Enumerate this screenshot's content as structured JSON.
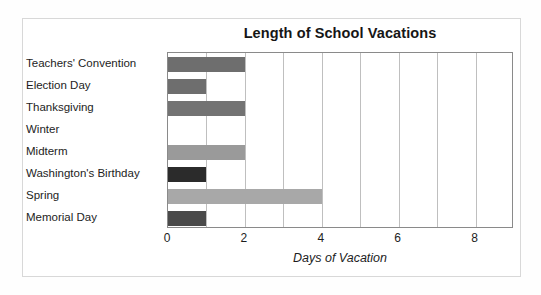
{
  "chart_data": {
    "type": "bar",
    "orientation": "horizontal",
    "title": "Length of School Vacations",
    "xlabel": "Days of Vacation",
    "ylabel": "",
    "xlim": [
      0,
      9
    ],
    "xticks": [
      "0",
      "2",
      "4",
      "6",
      "8"
    ],
    "xtick_values": [
      0,
      2,
      4,
      6,
      8
    ],
    "gridlines_x": [
      0,
      1,
      2,
      3,
      4,
      5,
      6,
      7,
      8,
      9
    ],
    "grid": true,
    "legend": "none",
    "categories": [
      "Teachers' Convention",
      "Election Day",
      "Thanksgiving",
      "Winter",
      "Midterm",
      "Washington's Birthday",
      "Spring",
      "Memorial Day"
    ],
    "values": [
      2,
      1,
      2,
      0,
      2,
      1,
      4,
      1
    ],
    "bar_colors": [
      "#6e6e6e",
      "#6e6e6e",
      "#737373",
      "#ffffff",
      "#9a9a9a",
      "#2b2b2b",
      "#a8a8a8",
      "#4a4a4a"
    ]
  },
  "figure": {
    "background_color": "#ffffff",
    "frame_color": "#d8d8d8",
    "axis_color": "#8a8a8a",
    "gridline_color": "#bfbfbf"
  }
}
